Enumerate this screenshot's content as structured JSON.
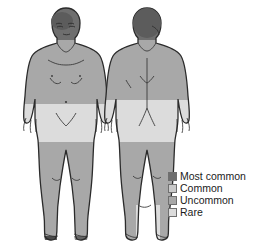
{
  "diagram": {
    "type": "human-body-shading-map",
    "views": [
      {
        "name": "anterior",
        "label": "Front view figure"
      },
      {
        "name": "posterior",
        "label": "Back view figure"
      }
    ],
    "background_color": "#ffffff",
    "outline_color": "#2b2b2b"
  },
  "severity_scale": {
    "most_common_color": "#6e6e6e",
    "common_color": "#c9c9c9",
    "uncommon_color": "#a8a8a8",
    "rare_color": "#dcdcdc"
  },
  "legend": {
    "items": [
      {
        "label": "Most common",
        "color": "#6e6e6e",
        "swatch_name": "swatch-most-common"
      },
      {
        "label": "Common",
        "color": "#c9c9c9",
        "swatch_name": "swatch-common"
      },
      {
        "label": "Uncommon",
        "color": "#a8a8a8",
        "swatch_name": "swatch-uncommon"
      },
      {
        "label": "Rare",
        "color": "#dcdcdc",
        "swatch_name": "swatch-rare"
      }
    ]
  },
  "regions": {
    "anterior": [
      {
        "name": "head",
        "severity": "Most common"
      },
      {
        "name": "torso",
        "severity": "Uncommon"
      },
      {
        "name": "arms",
        "severity": "Uncommon"
      },
      {
        "name": "pelvis",
        "severity": "Rare"
      },
      {
        "name": "thighs",
        "severity": "Rare"
      },
      {
        "name": "lower-legs",
        "severity": "Uncommon"
      },
      {
        "name": "feet",
        "severity": "Uncommon"
      }
    ],
    "posterior": [
      {
        "name": "head",
        "severity": "Most common"
      },
      {
        "name": "back",
        "severity": "Uncommon"
      },
      {
        "name": "arms",
        "severity": "Uncommon"
      },
      {
        "name": "buttocks",
        "severity": "Rare"
      },
      {
        "name": "thighs",
        "severity": "Rare"
      },
      {
        "name": "lower-legs",
        "severity": "Uncommon"
      },
      {
        "name": "left-ankle-foot",
        "severity": "Rare"
      },
      {
        "name": "right-foot",
        "severity": "Uncommon"
      }
    ]
  }
}
